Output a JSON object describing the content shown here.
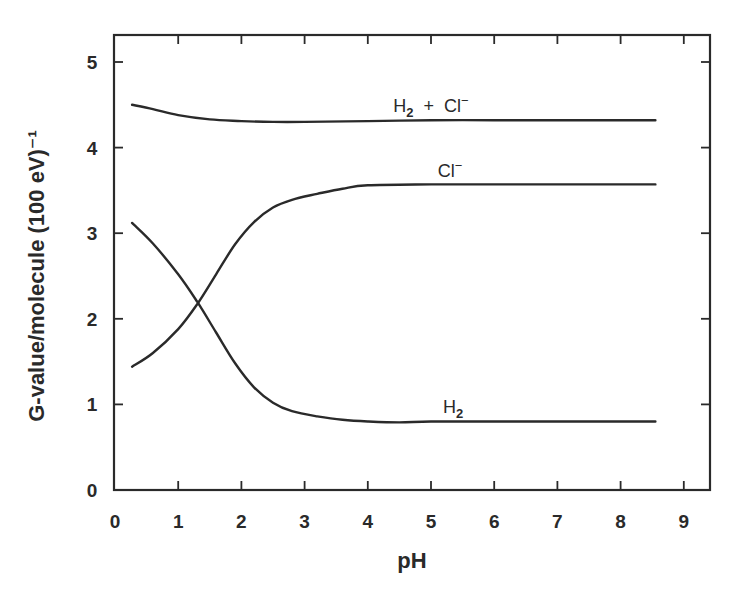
{
  "chart_data": {
    "type": "line",
    "title": "",
    "xlabel": "pH",
    "ylabel": "G-value/molecule (100 eV)⁻¹",
    "xlim": [
      0,
      9.45
    ],
    "ylim": [
      0,
      5.3
    ],
    "x_ticks": [
      "0",
      "1",
      "2",
      "3",
      "4",
      "5",
      "6",
      "7",
      "8",
      "9"
    ],
    "y_ticks": [
      "0",
      "1",
      "2",
      "3",
      "4",
      "5"
    ],
    "grid": false,
    "legend": "inline curve labels",
    "series": [
      {
        "name": "H2 + Cl-",
        "label_main": "H",
        "label_sub": "2",
        "label_rest": " + Cl",
        "label_sup": "−",
        "label_pos": [
          5.0,
          4.42
        ],
        "x": [
          0.27,
          0.6,
          1.0,
          1.5,
          2.0,
          2.5,
          3.0,
          4.0,
          5.0,
          6.0,
          7.0,
          8.0,
          8.55
        ],
        "y": [
          4.5,
          4.45,
          4.38,
          4.33,
          4.31,
          4.3,
          4.3,
          4.31,
          4.32,
          4.32,
          4.32,
          4.32,
          4.32
        ]
      },
      {
        "name": "Cl-",
        "label_main": "Cl",
        "label_sub": "",
        "label_rest": "",
        "label_sup": "−",
        "label_pos": [
          5.3,
          3.66
        ],
        "x": [
          0.27,
          0.6,
          1.0,
          1.3,
          1.6,
          1.9,
          2.2,
          2.5,
          2.8,
          3.2,
          3.6,
          4.0,
          5.0,
          6.0,
          7.0,
          8.0,
          8.55
        ],
        "y": [
          1.44,
          1.6,
          1.88,
          2.17,
          2.52,
          2.87,
          3.13,
          3.3,
          3.39,
          3.46,
          3.52,
          3.56,
          3.57,
          3.57,
          3.57,
          3.57,
          3.57
        ]
      },
      {
        "name": "H2",
        "label_main": "H",
        "label_sub": "2",
        "label_rest": "",
        "label_sup": "",
        "label_pos": [
          5.35,
          0.9
        ],
        "x": [
          0.27,
          0.6,
          1.0,
          1.3,
          1.6,
          1.9,
          2.2,
          2.5,
          2.8,
          3.2,
          3.6,
          4.0,
          4.5,
          5.0,
          6.0,
          7.0,
          8.0,
          8.55
        ],
        "y": [
          3.12,
          2.88,
          2.52,
          2.2,
          1.84,
          1.48,
          1.2,
          1.02,
          0.92,
          0.86,
          0.82,
          0.8,
          0.79,
          0.8,
          0.8,
          0.8,
          0.8,
          0.8
        ]
      }
    ]
  }
}
